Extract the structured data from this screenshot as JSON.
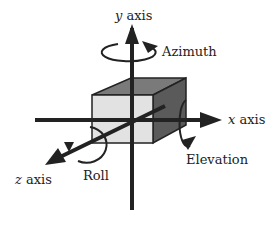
{
  "diagram": {
    "labels": {
      "y_axis": {
        "var": "y",
        "text": " axis"
      },
      "x_axis": {
        "var": "x",
        "text": " axis"
      },
      "z_axis": {
        "var": "z",
        "text": " axis"
      },
      "azimuth": "Azimuth",
      "elevation": "Elevation",
      "roll": "Roll"
    },
    "colors": {
      "cube_front": "#e2e2e2",
      "cube_top": "#7a7a7a",
      "cube_side": "#5a5a5a",
      "axis": "#222222"
    }
  }
}
